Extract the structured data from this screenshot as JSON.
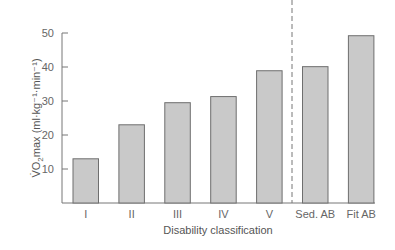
{
  "chart_data": {
    "type": "bar",
    "title": "",
    "xlabel": "Disability classification",
    "ylabel": "V̇O2max (ml·kg⁻¹·min⁻¹)",
    "categories": [
      "I",
      "II",
      "III",
      "IV",
      "V",
      "Sed. AB",
      "Fit AB"
    ],
    "values": [
      13,
      23,
      29.5,
      31.3,
      38.9,
      40.1,
      49.2
    ],
    "ylim": [
      0,
      50
    ],
    "yticks": [
      10,
      20,
      30,
      40,
      50
    ],
    "grid": false,
    "legend": null,
    "annotations": [
      "dashed vertical separator between V and Sed. AB"
    ]
  },
  "colors": {
    "bar_fill": "#c9c9c9",
    "bar_stroke": "#6e6e6e",
    "axis": "#777777"
  }
}
